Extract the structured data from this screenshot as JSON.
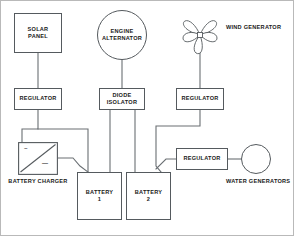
{
  "diagram": {
    "type": "block-diagram",
    "line_color": "#555a5e",
    "text_color": "#1a1a1a",
    "background": "#ffffff",
    "border_color": "#b9b9b9"
  },
  "nodes": {
    "solar_panel": {
      "line1": "SOLAR",
      "line2": "PANEL",
      "shape": "rect"
    },
    "engine_alternator": {
      "line1": "ENGINE",
      "line2": "ALTERNATOR",
      "shape": "ellipse"
    },
    "wind_generator": {
      "line1": "WIND",
      "line2": "GENERATOR",
      "shape": "turbine"
    },
    "regulator_solar": {
      "line1": "REGULATOR",
      "shape": "rect"
    },
    "diode_isolator": {
      "line1": "DIODE",
      "line2": "ISOLATOR",
      "shape": "rect"
    },
    "regulator_wind": {
      "line1": "REGULATOR",
      "shape": "rect"
    },
    "regulator_water": {
      "line1": "REGULATOR",
      "shape": "rect"
    },
    "battery_charger": {
      "line1": "BATTERY",
      "line2": "CHARGER",
      "shape": "rect-converter",
      "symbol_ac": "~",
      "symbol_dc": "—"
    },
    "battery_1": {
      "line1": "BATTERY",
      "line2": "1",
      "shape": "rect"
    },
    "battery_2": {
      "line1": "BATTERY",
      "line2": "2",
      "shape": "rect"
    },
    "water_generators": {
      "line1": "WATER",
      "line2": "GENERATORS",
      "shape": "circle"
    }
  },
  "connections": [
    {
      "from": "solar_panel",
      "to": "regulator_solar"
    },
    {
      "from": "regulator_solar",
      "to": "battery_charger"
    },
    {
      "from": "regulator_solar",
      "to": "battery_1"
    },
    {
      "from": "engine_alternator",
      "to": "diode_isolator"
    },
    {
      "from": "diode_isolator",
      "to": "battery_1"
    },
    {
      "from": "diode_isolator",
      "to": "battery_2"
    },
    {
      "from": "wind_generator",
      "to": "regulator_wind"
    },
    {
      "from": "regulator_wind",
      "to": "battery_2"
    },
    {
      "from": "battery_charger",
      "to": "battery_1"
    },
    {
      "from": "battery_2",
      "to": "regulator_water"
    },
    {
      "from": "regulator_water",
      "to": "water_generators"
    }
  ]
}
